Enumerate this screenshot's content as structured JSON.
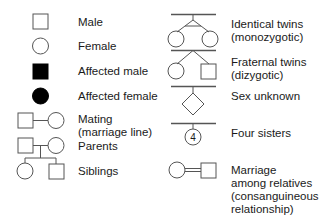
{
  "legend": {
    "left": [
      {
        "symbol": "square-empty",
        "label": "Male"
      },
      {
        "symbol": "circle-empty",
        "label": "Female"
      },
      {
        "symbol": "square-filled",
        "label": "Affected male"
      },
      {
        "symbol": "circle-filled",
        "label": "Affected female"
      },
      {
        "symbol": "mating-line",
        "label": "Mating (marriage line)"
      },
      {
        "symbol": "parents",
        "label": "Parents"
      },
      {
        "symbol": "siblings",
        "label": "Siblings"
      }
    ],
    "right": [
      {
        "symbol": "identical-twins",
        "label_line1": "Identical twins",
        "label_line2": "(monozygotic)"
      },
      {
        "symbol": "fraternal-twins",
        "label_line1": "Fraternal twins",
        "label_line2": "(dizygotic)"
      },
      {
        "symbol": "diamond",
        "label": "Sex unknown"
      },
      {
        "symbol": "numbered-circle",
        "label": "Four sisters",
        "count": "4"
      },
      {
        "symbol": "double-line-marriage",
        "label_line1": "Marriage",
        "label_line2": "among relatives",
        "label_line3": "(consanguineous",
        "label_line4": "relationship)"
      }
    ]
  },
  "colors": {
    "stroke": "#555555",
    "fill": "#000000",
    "text": "#1a1a1a"
  }
}
